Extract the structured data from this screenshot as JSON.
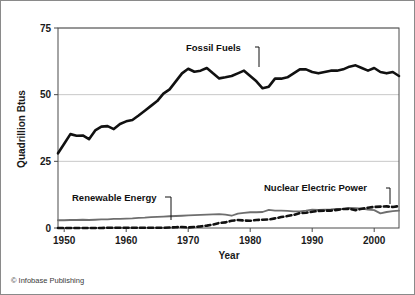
{
  "figure": {
    "credit": "© Infobase Publishing",
    "border_color": "#8a8a8a"
  },
  "chart_data": {
    "type": "line",
    "title": "",
    "subtitle": "",
    "xlabel": "Year",
    "ylabel": "Quadrillion Btus",
    "xlim": [
      1949,
      2004
    ],
    "ylim": [
      0,
      75
    ],
    "xticks": [
      1950,
      1960,
      1970,
      1980,
      1990,
      2000
    ],
    "xtick_labels": [
      "1950",
      "1960",
      "1970",
      "1980",
      "1990",
      "2000"
    ],
    "yticks": [
      0,
      25,
      50,
      75
    ],
    "ytick_labels": [
      "0",
      "25",
      "50",
      "75"
    ],
    "grid": "horizontal",
    "legend_position": "inline-annotations",
    "x": [
      1949,
      1950,
      1951,
      1952,
      1953,
      1954,
      1955,
      1956,
      1957,
      1958,
      1959,
      1960,
      1961,
      1962,
      1963,
      1964,
      1965,
      1966,
      1967,
      1968,
      1969,
      1970,
      1971,
      1972,
      1973,
      1974,
      1975,
      1976,
      1977,
      1978,
      1979,
      1980,
      1981,
      1982,
      1983,
      1984,
      1985,
      1986,
      1987,
      1988,
      1989,
      1990,
      1991,
      1992,
      1993,
      1994,
      1995,
      1996,
      1997,
      1998,
      1999,
      2000,
      2001,
      2002,
      2003,
      2004
    ],
    "series": [
      {
        "name": "Fossil Fuels",
        "color": "#111111",
        "style": "solid",
        "width": 2.6,
        "annotation": "Fossil Fuels",
        "values": [
          28.0,
          31.6,
          35.2,
          34.6,
          34.7,
          33.3,
          36.6,
          38.0,
          38.2,
          37.1,
          39.0,
          40.0,
          40.5,
          42.2,
          44.0,
          45.8,
          47.6,
          50.4,
          52.0,
          55.0,
          58.0,
          59.7,
          58.6,
          59.0,
          60.0,
          58.0,
          56.1,
          56.5,
          57.0,
          58.0,
          59.0,
          57.0,
          55.0,
          52.4,
          53.0,
          56.0,
          56.0,
          56.5,
          58.0,
          59.5,
          59.5,
          58.5,
          58.0,
          58.5,
          59.0,
          59.0,
          59.5,
          60.5,
          61.0,
          60.0,
          59.0,
          60.0,
          58.5,
          58.0,
          58.5,
          57.0
        ]
      },
      {
        "name": "Renewable Energy",
        "color": "#6e6e6e",
        "style": "solid",
        "width": 1.8,
        "annotation": "Renewable Energy",
        "values": [
          2.9,
          2.9,
          3.0,
          3.0,
          3.1,
          3.0,
          3.1,
          3.2,
          3.2,
          3.4,
          3.4,
          3.5,
          3.6,
          3.8,
          3.9,
          4.1,
          4.2,
          4.3,
          4.4,
          4.5,
          4.6,
          4.7,
          4.8,
          4.9,
          5.0,
          5.1,
          5.2,
          5.0,
          4.6,
          5.4,
          5.7,
          5.9,
          5.9,
          6.0,
          6.8,
          6.5,
          6.5,
          6.4,
          6.2,
          6.2,
          6.5,
          6.9,
          6.8,
          6.9,
          7.0,
          7.2,
          7.1,
          7.5,
          7.4,
          7.3,
          6.9,
          6.7,
          5.5,
          6.0,
          6.3,
          6.5
        ]
      },
      {
        "name": "Nuclear Electric Power",
        "color": "#111111",
        "style": "dashed",
        "width": 2.6,
        "annotation": "Nuclear Electric Power",
        "values": [
          0.0,
          0.0,
          0.0,
          0.0,
          0.0,
          0.0,
          0.0,
          0.0,
          0.1,
          0.1,
          0.1,
          0.1,
          0.1,
          0.1,
          0.1,
          0.1,
          0.1,
          0.1,
          0.2,
          0.3,
          0.4,
          0.2,
          0.4,
          0.6,
          0.9,
          1.3,
          1.9,
          2.1,
          2.7,
          3.0,
          2.8,
          2.7,
          3.0,
          3.1,
          3.2,
          3.6,
          4.1,
          4.5,
          4.9,
          5.6,
          5.7,
          6.1,
          6.4,
          6.5,
          6.5,
          6.8,
          7.1,
          7.2,
          6.7,
          7.2,
          7.6,
          7.9,
          8.0,
          8.1,
          7.9,
          8.2
        ]
      }
    ],
    "annotations": [
      {
        "label": "Fossil Fuels",
        "text_x": 185,
        "text_y": 50,
        "anchor": "start",
        "leader": "M 254 46 L 258 46 L 258 66"
      },
      {
        "label": "Renewable Energy",
        "text_x": 71,
        "text_y": 200,
        "anchor": "start",
        "leader": "M 164 196 L 170 196 L 170 219"
      },
      {
        "label": "Nuclear Electric Power",
        "text_x": 263,
        "text_y": 190,
        "anchor": "start",
        "leader": "M 385 187 L 389 187 L 389 203"
      }
    ]
  }
}
